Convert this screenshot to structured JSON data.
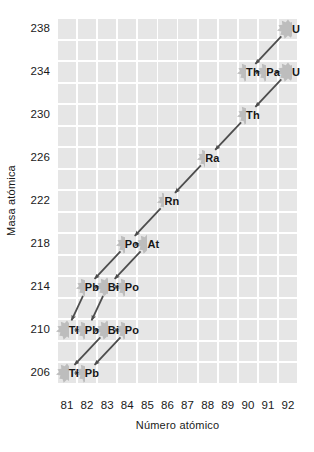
{
  "chart_data": {
    "type": "scatter",
    "title": "",
    "xlabel": "Número atómico",
    "ylabel": "Masa atómica",
    "xlim": [
      80.5,
      92.5
    ],
    "ylim": [
      204.5,
      239.5
    ],
    "xticks": [
      81,
      82,
      83,
      84,
      85,
      86,
      87,
      88,
      89,
      90,
      91,
      92
    ],
    "yticks": [
      238,
      234,
      230,
      226,
      222,
      218,
      214,
      210,
      206
    ],
    "grid": true,
    "legend": null,
    "nodes": [
      {
        "label": "U",
        "z": 92,
        "a": 238
      },
      {
        "label": "Th",
        "z": 90,
        "a": 234
      },
      {
        "label": "Pa",
        "z": 91,
        "a": 234
      },
      {
        "label": "U",
        "z": 92,
        "a": 234
      },
      {
        "label": "Th",
        "z": 90,
        "a": 230
      },
      {
        "label": "Ra",
        "z": 88,
        "a": 226
      },
      {
        "label": "Rn",
        "z": 86,
        "a": 222
      },
      {
        "label": "Po",
        "z": 84,
        "a": 218
      },
      {
        "label": "At",
        "z": 85,
        "a": 218
      },
      {
        "label": "Pb",
        "z": 82,
        "a": 214
      },
      {
        "label": "Bi",
        "z": 83,
        "a": 214
      },
      {
        "label": "Po",
        "z": 84,
        "a": 214
      },
      {
        "label": "Tl",
        "z": 81,
        "a": 210
      },
      {
        "label": "Pb",
        "z": 82,
        "a": 210
      },
      {
        "label": "Bi",
        "z": 83,
        "a": 210
      },
      {
        "label": "Po",
        "z": 84,
        "a": 210
      },
      {
        "label": "Tl",
        "z": 81,
        "a": 206
      },
      {
        "label": "Pb",
        "z": 82,
        "a": 206
      }
    ],
    "arrows": [
      {
        "from": [
          92,
          238
        ],
        "to": [
          90,
          234
        ],
        "kind": "alpha"
      },
      {
        "from": [
          90,
          234
        ],
        "to": [
          91,
          234
        ],
        "kind": "beta"
      },
      {
        "from": [
          91,
          234
        ],
        "to": [
          92,
          234
        ],
        "kind": "beta"
      },
      {
        "from": [
          92,
          234
        ],
        "to": [
          90,
          230
        ],
        "kind": "alpha"
      },
      {
        "from": [
          90,
          230
        ],
        "to": [
          88,
          226
        ],
        "kind": "alpha"
      },
      {
        "from": [
          88,
          226
        ],
        "to": [
          86,
          222
        ],
        "kind": "alpha"
      },
      {
        "from": [
          86,
          222
        ],
        "to": [
          84,
          218
        ],
        "kind": "alpha"
      },
      {
        "from": [
          84,
          218
        ],
        "to": [
          85,
          218
        ],
        "kind": "beta"
      },
      {
        "from": [
          84,
          218
        ],
        "to": [
          82,
          214
        ],
        "kind": "alpha"
      },
      {
        "from": [
          85,
          218
        ],
        "to": [
          83,
          214
        ],
        "kind": "alpha"
      },
      {
        "from": [
          82,
          214
        ],
        "to": [
          83,
          214
        ],
        "kind": "beta"
      },
      {
        "from": [
          83,
          214
        ],
        "to": [
          84,
          214
        ],
        "kind": "beta"
      },
      {
        "from": [
          82,
          214
        ],
        "to": [
          81,
          210
        ],
        "kind": "alpha"
      },
      {
        "from": [
          83,
          214
        ],
        "to": [
          82,
          210
        ],
        "kind": "alpha"
      },
      {
        "from": [
          81,
          210
        ],
        "to": [
          82,
          210
        ],
        "kind": "beta"
      },
      {
        "from": [
          82,
          210
        ],
        "to": [
          83,
          210
        ],
        "kind": "beta"
      },
      {
        "from": [
          83,
          210
        ],
        "to": [
          84,
          210
        ],
        "kind": "beta"
      },
      {
        "from": [
          83,
          210
        ],
        "to": [
          81,
          206
        ],
        "kind": "alpha"
      },
      {
        "from": [
          84,
          210
        ],
        "to": [
          82,
          206
        ],
        "kind": "alpha"
      },
      {
        "from": [
          81,
          206
        ],
        "to": [
          82,
          206
        ],
        "kind": "beta"
      }
    ],
    "colors": {
      "grid_cell": "#e6e6e6",
      "node_fill": "#bdbdbd",
      "arrow": "#4d4d4d",
      "text": "#1a1a1a",
      "background": "#ffffff"
    }
  }
}
